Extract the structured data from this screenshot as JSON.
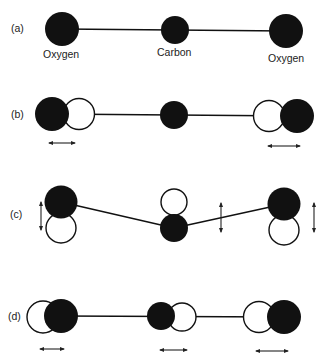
{
  "figure": {
    "colors": {
      "atom_filled": "#111111",
      "atom_hollow_fill": "#ffffff",
      "line": "#111111",
      "background": "#ffffff"
    },
    "panels": [
      {
        "id": "a",
        "label": "(a)",
        "description": "Equilibrium linear molecule",
        "atom_labels": [
          "Oxygen",
          "Carbon",
          "Oxygen"
        ]
      },
      {
        "id": "b",
        "label": "(b)",
        "description": "Symmetric stretch: oxygen atoms move outward along the axis",
        "motion_arrows": [
          "horizontal",
          "horizontal"
        ]
      },
      {
        "id": "c",
        "label": "(c)",
        "description": "Bending mode: atoms move perpendicular to the axis",
        "motion_arrows": [
          "vertical",
          "vertical",
          "vertical"
        ]
      },
      {
        "id": "d",
        "label": "(d)",
        "description": "Asymmetric stretch: all atoms displace along the axis",
        "motion_arrows": [
          "horizontal",
          "horizontal",
          "horizontal"
        ]
      }
    ]
  }
}
